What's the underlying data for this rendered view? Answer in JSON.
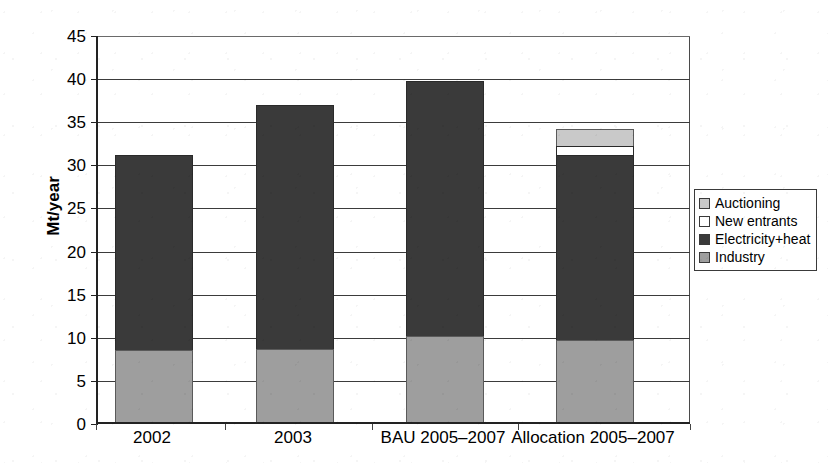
{
  "chart_data": {
    "type": "bar",
    "subtype": "stacked",
    "title": "",
    "xlabel": "",
    "ylabel": "Mt/year",
    "ylim": [
      0,
      45
    ],
    "ytick_step": 5,
    "yticks": [
      "0",
      "5",
      "10",
      "15",
      "20",
      "25",
      "30",
      "35",
      "40",
      "45"
    ],
    "grid": "horizontal",
    "legend_position": "right",
    "categories": [
      "2002",
      "2003",
      "BAU 2005–2007",
      "Allocation 2005–2007"
    ],
    "series": [
      {
        "name": "Industry",
        "color": "#9e9e9e",
        "values": [
          8.3,
          8.5,
          10.0,
          9.5
        ]
      },
      {
        "name": "Electricity+heat",
        "color": "#3a3a3a",
        "values": [
          22.7,
          28.3,
          29.6,
          21.5
        ]
      },
      {
        "name": "New entrants",
        "color": "#ffffff",
        "values": [
          0,
          0,
          0,
          1.0
        ]
      },
      {
        "name": "Auctioning",
        "color": "#c9c9c9",
        "values": [
          0,
          0,
          0,
          2.0
        ]
      }
    ],
    "totals": [
      31.0,
      36.8,
      39.6,
      34.0
    ]
  },
  "legend": {
    "items": [
      {
        "label": "Auctioning",
        "swatch": "#c9c9c9"
      },
      {
        "label": "New entrants",
        "swatch": "#ffffff"
      },
      {
        "label": "Electricity+heat",
        "swatch": "#3a3a3a"
      },
      {
        "label": "Industry",
        "swatch": "#9e9e9e"
      }
    ]
  }
}
